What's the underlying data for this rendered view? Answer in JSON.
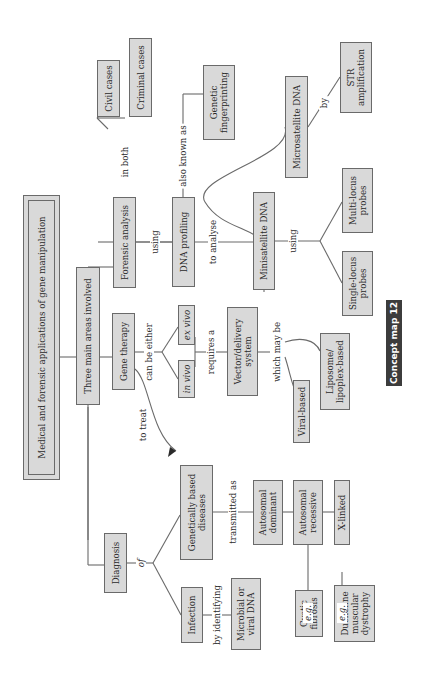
{
  "title": "Medical and forensic applications of gene manipulation",
  "badge": "Concept map 12",
  "colors": {
    "box_fill": "#d9d9d9",
    "box_border": "#6a6a6a",
    "line": "#6a6a6a",
    "badge_bg": "#3c3c3c",
    "badge_text": "#ffffff"
  },
  "nodes": {
    "three_areas": "Three main areas involved",
    "forensic": "Forensic analysis",
    "gene_therapy": "Gene therapy",
    "diagnosis": "Diagnosis",
    "civil": "Civil cases",
    "criminal": "Criminal cases",
    "dna_profiling": "DNA profiling",
    "genetic_fp": "Genetic\nfingerprinting",
    "microsatellite": "Microsatellite DNA",
    "str": "STR\namplification",
    "minisatellite": "Minisatellite DNA",
    "multi_locus": "Multi-locus\nprobes",
    "single_locus": "Single-locus\nprobes",
    "ex_vivo": "ex vivo",
    "in_vivo": "in vivo",
    "vector": "Vector/delivery\nsystem",
    "viral": "Viral-based",
    "liposome": "Liposome/\nlipoplex-based",
    "genetic_diseases": "Genetically based\ndiseases",
    "infection": "Infection",
    "microbial": "Microbial or\nviral DNA",
    "auto_dom": "Autosomal\ndominant",
    "auto_rec": "Autosomal\nrecessive",
    "x_linked": "X-linked",
    "cystic": "Cystic\nfibrosis",
    "duchenne": "Duchenne\nmuscular\ndystrophy"
  },
  "labels": {
    "in_both": "in both",
    "using1": "using",
    "also_known_as": "also known as",
    "to_analyse": "to analyse",
    "by": "by",
    "using2": "using",
    "can_be_either": "can be either",
    "requires_a": "requires a",
    "which_may_be": "which may be",
    "to_treat": "to treat",
    "of": "of",
    "transmitted_as": "transmitted as",
    "by_identifying": "by identifying",
    "eg1": "e.g.",
    "eg2": "e.g."
  }
}
